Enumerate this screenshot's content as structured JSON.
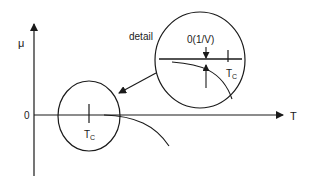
{
  "diagram": {
    "type": "phase-diagram-sketch",
    "axes": {
      "y_label": "μ",
      "x_label": "T",
      "origin_label": "0"
    },
    "main_view": {
      "tick_label_main": "T",
      "tick_label_sub": "C"
    },
    "detail_view": {
      "caption": "detail",
      "offset_label": "0(1/V)",
      "tick_label_main": "T",
      "tick_label_sub": "C"
    }
  }
}
